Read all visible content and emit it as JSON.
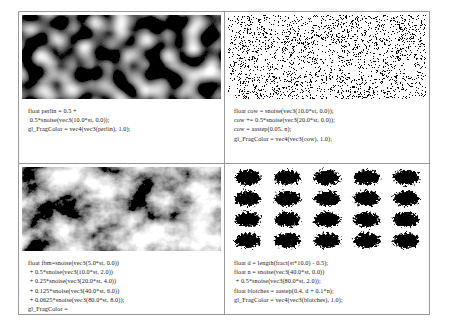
{
  "figure": {
    "border_color": "#999999",
    "background": "#ffffff"
  },
  "panels": [
    {
      "id": "perlin",
      "name": "perlin-noise-panel",
      "texture": {
        "name": "perlin-noise-texture",
        "description": "smooth grayscale perlin noise blobs",
        "style": "grayscale-smooth",
        "colors": [
          "#000000",
          "#ffffff"
        ]
      },
      "code_lines": [
        "float perlin = 0.5 +",
        " 0.5*snoise(vec3(10.0*st, 0.0));",
        "gl_FragColor = vec4(vec3(perlin), 1.0);"
      ]
    },
    {
      "id": "cow",
      "name": "cow-pattern-panel",
      "texture": {
        "name": "cow-pattern-texture",
        "description": "hard thresholded black and white cow spots",
        "style": "binary-threshold",
        "colors": [
          "#000000",
          "#ffffff"
        ]
      },
      "code_lines": [
        "float cow = snoise(vec3(10.0*st, 0.0));",
        "cow += 0.5*snoise(vec3(20.0*st, 0.0));",
        "cow = aastep(0.05, n);",
        "gl_FragColor = vec4(vec3(cow), 1.0);"
      ]
    },
    {
      "id": "fbm",
      "name": "fbm-noise-panel",
      "texture": {
        "name": "fbm-noise-texture",
        "description": "fractal brownian motion multi-octave grayscale noise",
        "style": "grayscale-fractal",
        "colors": [
          "#000000",
          "#ffffff"
        ]
      },
      "code_lines": [
        "float fbm=snoise(vec3(5.0*st, 0.0))",
        " + 0.5*snoise(vec3(10.0*st, 2.0))",
        " + 0.25*snoise(vec3(20.0*st, 4.0))",
        " + 0.125*snoise(vec3(40.0*st, 6.0))",
        " + 0.0625*snoise(vec3(80.0*st, 8.0));",
        "gl_FragColor =",
        " vec4(0.4*vec3(fbm) + 0.5, 1.0);"
      ]
    },
    {
      "id": "blotches",
      "name": "blotches-panel",
      "texture": {
        "name": "blotches-texture",
        "description": "grid of ragged black blotches on white",
        "style": "blotch-grid",
        "colors": [
          "#000000",
          "#ffffff"
        ],
        "grid_columns": 5,
        "grid_rows": 4
      },
      "code_lines": [
        "float d = length(fract(st*10.0) - 0.5);",
        "float n = snoise(vec3(40.0*st, 0.0))",
        " + 0.5*snoise(vec3(80.0*st, 2.0));",
        "float blotches = aastep(0.4, d + 0.1*n);",
        "gl_FragColor = vec4(vec3(blotches), 1.0);"
      ]
    }
  ]
}
